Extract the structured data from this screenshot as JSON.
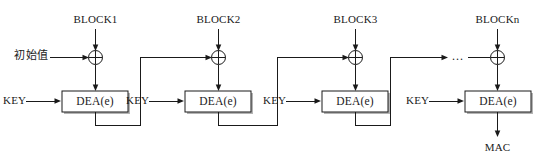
{
  "diagram": {
    "colors": {
      "line": "#1a1a1a",
      "background": "#ffffff",
      "shadow": "#b4b4b4",
      "box_fill": "#ffffff"
    },
    "initial_value_label": "初始值",
    "output_label": "MAC",
    "ellipsis": "...",
    "stages": [
      {
        "block_label": "BLOCK1",
        "key_label": "KEY",
        "box_label": "DEA(e)"
      },
      {
        "block_label": "BLOCK2",
        "key_label": "KEY",
        "box_label": "DEA(e)"
      },
      {
        "block_label": "BLOCK3",
        "key_label": "KEY",
        "box_label": "DEA(e)"
      },
      {
        "block_label": "BLOCKn",
        "key_label": "KEY",
        "box_label": "DEA(e)"
      }
    ]
  }
}
